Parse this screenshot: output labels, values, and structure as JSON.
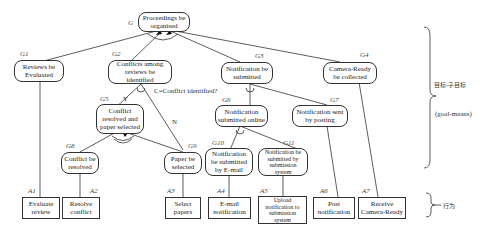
{
  "diagram": {
    "goals": [
      {
        "id": "G",
        "label": "G",
        "text": "Proceedings be organised"
      },
      {
        "id": "G1",
        "label": "G1",
        "text": "Reviews be Evaluated"
      },
      {
        "id": "G2",
        "label": "G2",
        "text": "Conflicts among reviews be identified"
      },
      {
        "id": "G3",
        "label": "G3",
        "text": "Notification be submitted"
      },
      {
        "id": "G4",
        "label": "G4",
        "text": "Camera-Ready be collected"
      },
      {
        "id": "G5",
        "label": "G5",
        "text": "Conflict resolved and paper selected"
      },
      {
        "id": "G6",
        "label": "G6",
        "text": "Notification submitted online"
      },
      {
        "id": "G7",
        "label": "G7",
        "text": "Notification sent by posting"
      },
      {
        "id": "G8",
        "label": "G8",
        "text": "Conflict be resolved"
      },
      {
        "id": "G9",
        "label": "G9",
        "text": "Paper be selected"
      },
      {
        "id": "G10",
        "label": "G10",
        "text": "Notification be submitted by E-mail"
      },
      {
        "id": "G11",
        "label": "G11",
        "text": "Notification be submitted by submission system"
      }
    ],
    "actions": [
      {
        "id": "A1",
        "label": "A1",
        "text": "Evaluate review"
      },
      {
        "id": "A2",
        "label": "A2",
        "text": "Resolve conflict"
      },
      {
        "id": "A3",
        "label": "A3",
        "text": "Select papers"
      },
      {
        "id": "A4",
        "label": "A4",
        "text": "E-mail notification"
      },
      {
        "id": "A5",
        "label": "A5",
        "text": "Upload notification to submission system"
      },
      {
        "id": "A6",
        "label": "A6",
        "text": "Post notification"
      },
      {
        "id": "A7",
        "label": "A7",
        "text": "Receive Camera-Ready"
      }
    ],
    "condition": "C=Conflict identified?",
    "branch_yes": "Y",
    "branch_no": "N",
    "legend": {
      "goal_subgoal_cn": "目标-子目标",
      "goal_means": "(goal-means)",
      "behavior_cn": "行为"
    }
  }
}
